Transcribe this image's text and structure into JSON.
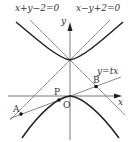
{
  "figure": {
    "type": "math-diagram",
    "labels": {
      "asymptote_left": "x+y−2=0",
      "asymptote_right": "x−y+2=0",
      "y_axis": "y",
      "x_axis": "x",
      "line": "y=tx",
      "point_A": "A",
      "point_B": "B",
      "point_P": "P",
      "origin": "O"
    },
    "colors": {
      "curve": "#222222",
      "line": "#555555",
      "axis": "#555555",
      "point": "#111111"
    },
    "elements": [
      {
        "kind": "axis",
        "name": "x-axis"
      },
      {
        "kind": "axis",
        "name": "y-axis"
      },
      {
        "kind": "line",
        "equation": "x+y-2=0"
      },
      {
        "kind": "line",
        "equation": "x-y+2=0"
      },
      {
        "kind": "line",
        "equation": "y=tx"
      },
      {
        "kind": "curve",
        "name": "upper hyperbola branch"
      },
      {
        "kind": "curve",
        "name": "lower curve through O"
      },
      {
        "kind": "point",
        "name": "A"
      },
      {
        "kind": "point",
        "name": "P"
      },
      {
        "kind": "point",
        "name": "B"
      }
    ]
  }
}
